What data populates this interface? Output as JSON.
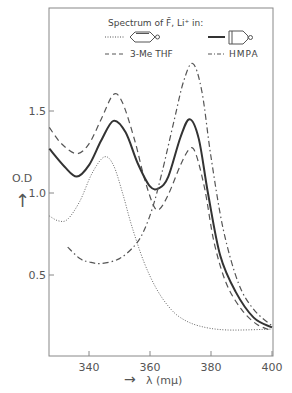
{
  "chart_data": {
    "type": "line",
    "xlabel": "λ (mμ)",
    "ylabel": "O.D",
    "xlim": [
      327,
      400
    ],
    "ylim": [
      0.1,
      1.95
    ],
    "xticks": [
      340,
      360,
      380,
      400
    ],
    "yticks": [
      0.5,
      1.0,
      1.5
    ],
    "xtick_labels": [
      "340",
      "360",
      "380",
      "400"
    ],
    "ytick_labels": [
      "0.5",
      "1.0",
      "1.5"
    ],
    "grid": false,
    "legend_position": "top",
    "series": [
      {
        "name": "cyclohexene-ring solvent (dotted)",
        "style": "dotted",
        "x": [
          327,
          330,
          333,
          337,
          341,
          345,
          348,
          351,
          354,
          358,
          362,
          366,
          370,
          376,
          385,
          400
        ],
        "values": [
          0.86,
          0.83,
          0.84,
          0.95,
          1.12,
          1.22,
          1.17,
          1.0,
          0.8,
          0.58,
          0.42,
          0.31,
          0.24,
          0.19,
          0.165,
          0.17
        ]
      },
      {
        "name": "3-Me THF",
        "style": "dashed",
        "x": [
          327,
          331,
          336,
          340,
          344,
          348,
          351,
          355,
          358,
          361,
          363,
          366,
          370,
          373,
          375,
          378,
          381,
          385,
          390,
          395,
          400
        ],
        "values": [
          1.4,
          1.3,
          1.24,
          1.3,
          1.45,
          1.6,
          1.55,
          1.32,
          1.1,
          0.93,
          0.9,
          0.99,
          1.17,
          1.27,
          1.24,
          1.02,
          0.7,
          0.45,
          0.29,
          0.2,
          0.16
        ]
      },
      {
        "name": "solid (vessel-icon solvent)",
        "style": "solid",
        "x": [
          327,
          332,
          336,
          340,
          344,
          348,
          352,
          356,
          360,
          363,
          366,
          370,
          373,
          376,
          379,
          383,
          388,
          394,
          400
        ],
        "values": [
          1.27,
          1.16,
          1.1,
          1.17,
          1.32,
          1.44,
          1.37,
          1.18,
          1.04,
          1.03,
          1.1,
          1.34,
          1.45,
          1.33,
          1.0,
          0.62,
          0.4,
          0.24,
          0.18
        ]
      },
      {
        "name": "HMPA",
        "style": "dashdot",
        "x": [
          333,
          337,
          340,
          344,
          350,
          355,
          358,
          361,
          364,
          368,
          371,
          374,
          377,
          380,
          384,
          389,
          394,
          400
        ],
        "values": [
          0.67,
          0.6,
          0.58,
          0.57,
          0.6,
          0.68,
          0.77,
          0.92,
          1.13,
          1.45,
          1.68,
          1.79,
          1.62,
          1.22,
          0.78,
          0.45,
          0.29,
          0.19
        ]
      }
    ]
  },
  "legend": {
    "title": "Spectrum of F̄, Li⁺ in:",
    "entries": [
      {
        "label": "",
        "style": "dotted",
        "icon": "cyclohexene-ring-icon"
      },
      {
        "label": "",
        "style": "solid",
        "icon": "vessel-icon"
      },
      {
        "label": "3-Me THF",
        "style": "dashed"
      },
      {
        "label": "HMPA",
        "style": "dashdot"
      }
    ]
  },
  "axes": {
    "ylabel_text": "O.D",
    "xlabel_text": "λ (mμ)",
    "arrow_glyph": "→",
    "up_arrow_glyph": "↑"
  }
}
